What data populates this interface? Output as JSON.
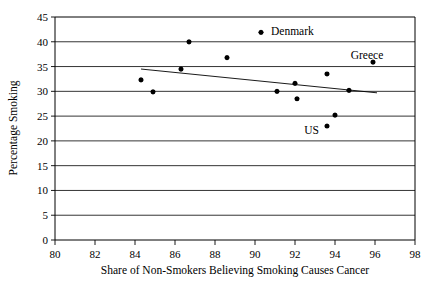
{
  "chart_data": {
    "type": "scatter",
    "title": "",
    "xlabel": "Share of Non-Smokers Believing Smoking Causes Cancer",
    "ylabel": "Percentage Smoking",
    "xlim": [
      80,
      98
    ],
    "ylim": [
      0,
      45
    ],
    "xticks": [
      80,
      82,
      84,
      86,
      88,
      90,
      92,
      94,
      96,
      98
    ],
    "yticks": [
      0,
      5,
      10,
      15,
      20,
      25,
      30,
      35,
      40,
      45
    ],
    "grid": "horizontal",
    "legend": "none",
    "marker_color": "#000000",
    "points": [
      {
        "x": 84.3,
        "y": 32.3,
        "label": ""
      },
      {
        "x": 84.9,
        "y": 29.9,
        "label": ""
      },
      {
        "x": 86.3,
        "y": 34.5,
        "label": ""
      },
      {
        "x": 86.7,
        "y": 40.0,
        "label": ""
      },
      {
        "x": 88.6,
        "y": 36.8,
        "label": ""
      },
      {
        "x": 90.3,
        "y": 41.9,
        "label": "Denmark"
      },
      {
        "x": 91.1,
        "y": 30.0,
        "label": ""
      },
      {
        "x": 92.0,
        "y": 31.6,
        "label": ""
      },
      {
        "x": 92.1,
        "y": 28.5,
        "label": ""
      },
      {
        "x": 93.6,
        "y": 33.5,
        "label": ""
      },
      {
        "x": 93.6,
        "y": 23.0,
        "label": "US"
      },
      {
        "x": 94.0,
        "y": 25.2,
        "label": ""
      },
      {
        "x": 94.7,
        "y": 30.2,
        "label": ""
      },
      {
        "x": 95.9,
        "y": 35.9,
        "label": "Greece"
      }
    ],
    "trendline": {
      "x_start": 84.3,
      "y_start": 34.5,
      "x_end": 96.1,
      "y_end": 29.7
    },
    "annotations": [
      {
        "text": "Denmark",
        "x": 90.8,
        "y": 42.2,
        "anchor": "start"
      },
      {
        "text": "Greece",
        "x": 95.6,
        "y": 37.4,
        "anchor": "middle"
      },
      {
        "text": "US",
        "x": 93.2,
        "y": 22.2,
        "anchor": "end"
      }
    ]
  },
  "axes": {
    "y_title": "Percentage Smoking",
    "x_title": "Share of Non-Smokers Believing Smoking Causes Cancer",
    "x_tick_labels": [
      "80",
      "82",
      "84",
      "86",
      "88",
      "90",
      "92",
      "94",
      "96",
      "98"
    ],
    "y_tick_labels": [
      "0",
      "5",
      "10",
      "15",
      "20",
      "25",
      "30",
      "35",
      "40",
      "45"
    ]
  }
}
